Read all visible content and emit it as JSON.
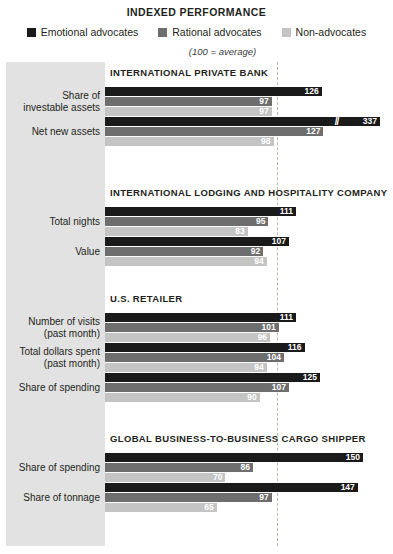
{
  "header": {
    "title": "INDEXED PERFORMANCE",
    "axis_note": "(100 = average)"
  },
  "legend": [
    {
      "label": "Emotional advocates",
      "color": "#1a1a1a"
    },
    {
      "label": "Rational advocates",
      "color": "#6e6e6e"
    },
    {
      "label": "Non-advocates",
      "color": "#c4c4c4"
    }
  ],
  "chart_data": {
    "type": "bar",
    "title": "INDEXED PERFORMANCE",
    "subtitle": "(100 = average)",
    "orientation": "horizontal",
    "xlabel": "",
    "ylabel": "",
    "xlim": [
      0,
      160
    ],
    "reference_line": 100,
    "grid": false,
    "legend_position": "top",
    "series": [
      {
        "name": "Emotional advocates",
        "color": "#1a1a1a"
      },
      {
        "name": "Rational advocates",
        "color": "#6e6e6e"
      },
      {
        "name": "Non-advocates",
        "color": "#c4c4c4"
      }
    ],
    "sections": [
      {
        "title": "INTERNATIONAL PRIVATE BANK",
        "rows": [
          {
            "label": "Share of",
            "label2": "investable assets",
            "values": [
              126,
              97,
              97
            ],
            "broken": [
              false,
              false,
              false
            ]
          },
          {
            "label": "Net new assets",
            "label2": "",
            "values": [
              337,
              127,
              98
            ],
            "broken": [
              true,
              false,
              false
            ]
          }
        ]
      },
      {
        "title": "INTERNATIONAL LODGING AND HOSPITALITY COMPANY",
        "rows": [
          {
            "label": "Total nights",
            "label2": "",
            "values": [
              111,
              95,
              83
            ],
            "broken": [
              false,
              false,
              false
            ]
          },
          {
            "label": "Value",
            "label2": "",
            "values": [
              107,
              92,
              94
            ],
            "broken": [
              false,
              false,
              false
            ]
          }
        ]
      },
      {
        "title": "U.S. RETAILER",
        "rows": [
          {
            "label": "Number of visits",
            "label2": "(past month)",
            "values": [
              111,
              101,
              96
            ],
            "broken": [
              false,
              false,
              false
            ]
          },
          {
            "label": "Total dollars spent",
            "label2": "(past month)",
            "values": [
              116,
              104,
              94
            ],
            "broken": [
              false,
              false,
              false
            ]
          },
          {
            "label": "Share of spending",
            "label2": "",
            "values": [
              125,
              107,
              90
            ],
            "broken": [
              false,
              false,
              false
            ]
          }
        ]
      },
      {
        "title": "GLOBAL BUSINESS-TO-BUSINESS CARGO SHIPPER",
        "rows": [
          {
            "label": "Share of spending",
            "label2": "",
            "values": [
              150,
              86,
              70
            ],
            "broken": [
              false,
              false,
              false
            ]
          },
          {
            "label": "Share of tonnage",
            "label2": "",
            "values": [
              147,
              97,
              65
            ],
            "broken": [
              false,
              false,
              false
            ]
          }
        ]
      }
    ]
  }
}
